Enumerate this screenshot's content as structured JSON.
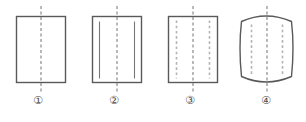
{
  "figure": {
    "kind": "engineering-drawing-multiple-views",
    "background_color": "#ffffff",
    "outline_color": "#595959",
    "centerline_color": "#8a8a8a",
    "hidden_line_color": "#b3b3b3",
    "inner_line_color": "#777777",
    "caption_color": "#4a4a4a",
    "items": [
      {
        "id": "fig-1",
        "caption": "①",
        "caption_text": "circled-1",
        "shape": "rectangle",
        "body_left": 16,
        "body_top": 16,
        "body_width": 49,
        "body_height": 66,
        "centerline_top": 6,
        "centerline_bottom": 92,
        "inner_lines": "none"
      },
      {
        "id": "fig-2",
        "caption": "②",
        "caption_text": "circled-2",
        "shape": "rectangle",
        "body_left": 16,
        "body_top": 16,
        "body_width": 49,
        "body_height": 66,
        "centerline_top": 6,
        "centerline_bottom": 92,
        "inner_lines": "solid-pair",
        "inner_line_inset": 7,
        "inner_line_top_gap": 5,
        "inner_line_bottom_gap": 4
      },
      {
        "id": "fig-3",
        "caption": "③",
        "caption_text": "circled-3",
        "shape": "rectangle",
        "body_left": 16,
        "body_top": 16,
        "body_width": 49,
        "body_height": 66,
        "centerline_top": 6,
        "centerline_bottom": 92,
        "inner_lines": "dashed-pair",
        "inner_line_inset": 8,
        "inner_line_top_gap": 4,
        "inner_line_bottom_gap": 4
      },
      {
        "id": "fig-4",
        "caption": "④",
        "caption_text": "circled-4",
        "shape": "barrel-curved-top-bottom",
        "body_left": 13,
        "body_top": 13,
        "body_width": 53,
        "body_height": 69,
        "top_arc_rise": 8,
        "bottom_arc_rise": 8,
        "side_arc_bulge": 3,
        "centerline_top": 6,
        "centerline_bottom": 92,
        "inner_lines": "dashed-pair",
        "inner_line_inset": 9,
        "inner_line_top_gap": 6,
        "inner_line_bottom_gap": 6
      }
    ],
    "cell_origins": [
      0,
      76,
      152,
      228
    ]
  }
}
